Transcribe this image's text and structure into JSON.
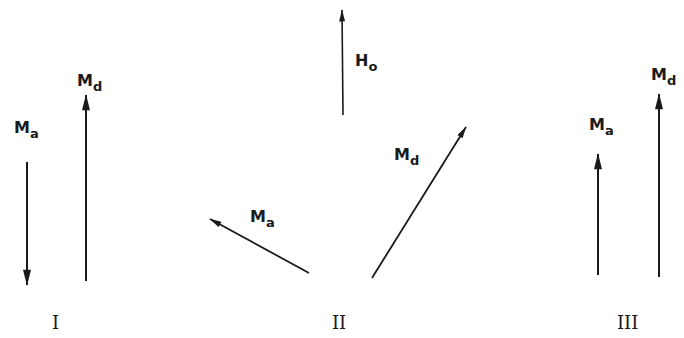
{
  "panels": [
    {
      "numeral": "I",
      "vectors": [
        {
          "name": "M",
          "sub": "a",
          "direction": "down"
        },
        {
          "name": "M",
          "sub": "d",
          "direction": "up"
        }
      ]
    },
    {
      "numeral": "II",
      "vectors": [
        {
          "name": "H",
          "sub": "o",
          "direction": "up"
        },
        {
          "name": "M",
          "sub": "a",
          "direction": "up-left"
        },
        {
          "name": "M",
          "sub": "d",
          "direction": "up-right"
        }
      ]
    },
    {
      "numeral": "III",
      "vectors": [
        {
          "name": "M",
          "sub": "a",
          "direction": "up"
        },
        {
          "name": "M",
          "sub": "d",
          "direction": "up"
        }
      ]
    }
  ],
  "colors": {
    "ink": "#1a1a1a",
    "background": "#ffffff"
  }
}
